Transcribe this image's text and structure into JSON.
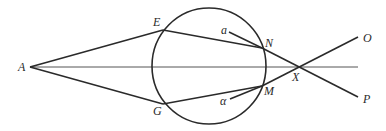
{
  "diagram": {
    "type": "ray-optics-geometry",
    "colors": {
      "line": "#2a2a2a",
      "axis": "#555555",
      "background": "#ffffff"
    },
    "points": {
      "A": {
        "label": "A",
        "x": 30,
        "y": 67
      },
      "E": {
        "label": "E",
        "x": 163,
        "y": 30
      },
      "G": {
        "label": "G",
        "x": 163,
        "y": 104
      },
      "N": {
        "label": "N",
        "x": 262,
        "y": 48
      },
      "M": {
        "label": "M",
        "x": 262,
        "y": 86
      },
      "X": {
        "label": "X",
        "x": 298,
        "y": 67
      },
      "O": {
        "label": "O",
        "x": 358,
        "y": 37
      },
      "P": {
        "label": "P",
        "x": 358,
        "y": 97
      },
      "a": {
        "label": "a",
        "x": 229,
        "y": 32
      },
      "alpha": {
        "label": "α",
        "x": 230,
        "y": 99
      }
    },
    "circle": {
      "cx": 209,
      "cy": 66,
      "rx": 57,
      "ry": 58
    }
  }
}
